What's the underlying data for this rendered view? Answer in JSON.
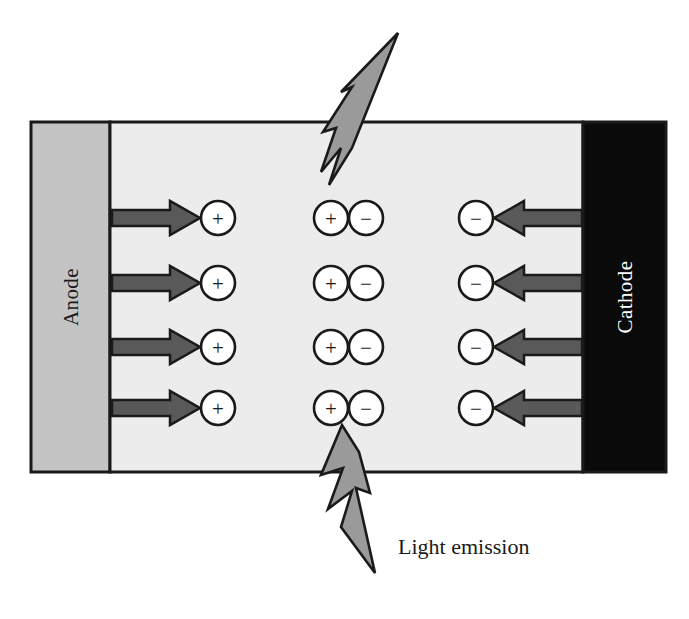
{
  "diagram": {
    "canvas": {
      "width": 689,
      "height": 619,
      "background": "#ffffff"
    },
    "colors": {
      "anode_fill": "#c4c4c4",
      "cathode_fill": "#0a0a0a",
      "emissive_fill": "#ececec",
      "outline": "#1a1a1a",
      "arrow_fill": "#595959",
      "bolt_fill": "#9a9a9a",
      "cathode_label_color": "#ffffff",
      "anode_label_color": "#1a1a1a",
      "caption_color": "#1a1a1a"
    },
    "layers": [
      {
        "id": "anode",
        "label": "Anode",
        "label_orientation": "vertical-bottom-to-top",
        "fill": "#c4c4c4",
        "text_color": "#1a1a1a",
        "x": 31,
        "y": 122,
        "width": 79,
        "height": 350
      },
      {
        "id": "emissive",
        "label": "",
        "label_orientation": "none",
        "fill": "#ececec",
        "text_color": "#1a1a1a",
        "x": 110,
        "y": 122,
        "width": 473,
        "height": 350
      },
      {
        "id": "cathode",
        "label": "Cathode",
        "label_orientation": "vertical-bottom-to-top",
        "fill": "#0a0a0a",
        "text_color": "#ffffff",
        "x": 583,
        "y": 122,
        "width": 83,
        "height": 350
      }
    ],
    "charge_rows": [
      218,
      283,
      347,
      408
    ],
    "columns": {
      "hole_x": 218,
      "pair_positive_x": 331,
      "pair_negative_x": 366,
      "electron_x": 476
    },
    "circle_radius": 17,
    "charges": {
      "hole_symbol": "+",
      "electron_symbol": "−",
      "hole_name": "positive charge carrier",
      "electron_name": "negative charge carrier"
    },
    "arrows": {
      "hole_injection": {
        "name": "hole-injection-arrow",
        "direction": "right",
        "from_x": 112,
        "to_x": 200,
        "shaft_half_height": 8,
        "head_half_height": 17,
        "head_length": 30,
        "count": 4
      },
      "electron_injection": {
        "name": "electron-injection-arrow",
        "direction": "left",
        "from_x": 582,
        "to_x": 494,
        "shaft_half_height": 8,
        "head_half_height": 17,
        "head_length": 30,
        "count": 4
      }
    },
    "light_bolts": [
      {
        "id": "bolt-top",
        "name": "light-emission-bolt-top",
        "points": "398,33 352,148 329,185 341,148 321,172 336,128 323,132 352,87 341,92",
        "description": "upward-right lightning bolt escaping through the top of the device"
      },
      {
        "id": "bolt-bottom",
        "name": "light-emission-bolt-bottom",
        "points": "342,425 321,475 343,468 328,509 352,491 341,527 375,573 356,488 370,493 359,452",
        "description": "downward-right lightning bolt escaping through the bottom of the device"
      }
    ],
    "caption": {
      "text": "Light emission",
      "x": 398,
      "y": 549
    }
  }
}
